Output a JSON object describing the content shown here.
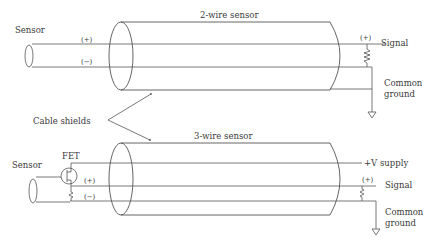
{
  "diagram": {
    "title_top": "2-wire sensor",
    "title_bottom": "3-wire sensor",
    "top": {
      "sensor_label": "Sensor",
      "plus_label": "(+)",
      "minus_label": "(−)",
      "resistor_plus_label": "(+)",
      "signal_label": "Signal",
      "ground_label_line1": "Common",
      "ground_label_line2": "ground"
    },
    "bottom": {
      "sensor_label": "Sensor",
      "fet_label": "FET",
      "plus_label": "(+)",
      "minus_label": "(−)",
      "supply_label": "+V supply",
      "resistor_plus_label": "(+)",
      "signal_label": "Signal",
      "ground_label_line1": "Common",
      "ground_label_line2": "ground"
    },
    "cable_shields_label": "Cable shields",
    "colors": {
      "line": "#555555",
      "text": "#3a3a3a",
      "background": "#ffffff"
    }
  }
}
